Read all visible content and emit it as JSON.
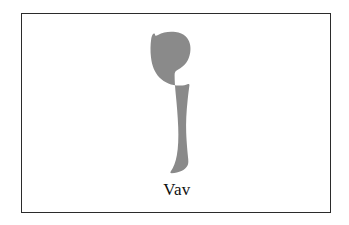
{
  "card": {
    "letter_name": "Vav",
    "glyph_label": "hebrew-letter-vav-glyph",
    "glyph_character": "ו",
    "frame_color": "#2b2b2b",
    "glyph_color": "#8a8a8a",
    "background_color": "#ffffff",
    "text_color": "#101010"
  }
}
